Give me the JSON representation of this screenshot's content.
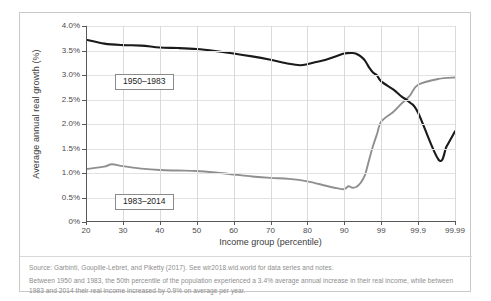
{
  "chart_data": {
    "type": "line",
    "title": "",
    "xlabel": "Income group (percentile)",
    "ylabel": "Average annual real growth (%)",
    "x_tick_labels": [
      "20",
      "30",
      "40",
      "50",
      "60",
      "70",
      "80",
      "90",
      "99",
      "99.9",
      "99.99"
    ],
    "y_tick_labels": [
      "0%",
      "0.5%",
      "1.0%",
      "1.5%",
      "2.0%",
      "2.5%",
      "3.0%",
      "3.5%",
      "4.0%"
    ],
    "ylim": [
      0,
      4.0
    ],
    "y_unit": "%",
    "x_scale": "percentile (evenly spaced categorical ticks: 20..90 decile then 99, 99.9, 99.99)",
    "grid": "both",
    "legend_position": "inline-boxes",
    "series": [
      {
        "name": "1950–1983",
        "color": "#1a1a1a",
        "x": [
          20,
          25,
          30,
          35,
          40,
          45,
          50,
          55,
          60,
          65,
          70,
          75,
          78,
          80,
          82,
          85,
          88,
          90,
          92,
          93,
          94,
          95,
          96,
          97,
          98,
          99,
          99.3,
          99.5,
          99.7,
          99.9,
          99.95,
          99.97,
          99.99
        ],
        "values": [
          3.72,
          3.64,
          3.61,
          3.6,
          3.56,
          3.55,
          3.53,
          3.49,
          3.44,
          3.38,
          3.31,
          3.23,
          3.2,
          3.22,
          3.26,
          3.31,
          3.39,
          3.44,
          3.45,
          3.43,
          3.38,
          3.3,
          3.16,
          3.05,
          2.99,
          2.87,
          2.7,
          2.56,
          2.44,
          2.23,
          1.27,
          1.55,
          1.85
        ]
      },
      {
        "name": "1983–2014",
        "color": "#8f8f8f",
        "x": [
          20,
          25,
          27,
          30,
          35,
          40,
          45,
          50,
          55,
          60,
          65,
          70,
          75,
          80,
          85,
          88,
          90,
          91,
          92,
          93,
          94,
          95,
          96,
          97,
          98,
          99,
          99.3,
          99.5,
          99.7,
          99.9,
          99.95,
          99.99
        ],
        "values": [
          1.08,
          1.13,
          1.18,
          1.14,
          1.09,
          1.06,
          1.05,
          1.04,
          1.01,
          0.97,
          0.93,
          0.9,
          0.88,
          0.83,
          0.74,
          0.69,
          0.67,
          0.73,
          0.7,
          0.72,
          0.8,
          0.95,
          1.25,
          1.55,
          1.8,
          2.05,
          2.25,
          2.42,
          2.58,
          2.8,
          2.92,
          2.95
        ]
      }
    ],
    "annotations": [
      {
        "text": "1950–1983",
        "type": "series-label-box"
      },
      {
        "text": "1983–2014",
        "type": "series-label-box"
      }
    ]
  },
  "notes": {
    "source": "Source: Garbinti, Goupille-Lebret, and Piketty (2017). See wir2018.wid.world for data series and notes.",
    "explainer": "Between 1950 and 1983, the 50th percentile of the population experienced a 3.4% average annual increase in their real income, while between 1983 and 2014 their real income increased by 0.9% on average per year."
  }
}
